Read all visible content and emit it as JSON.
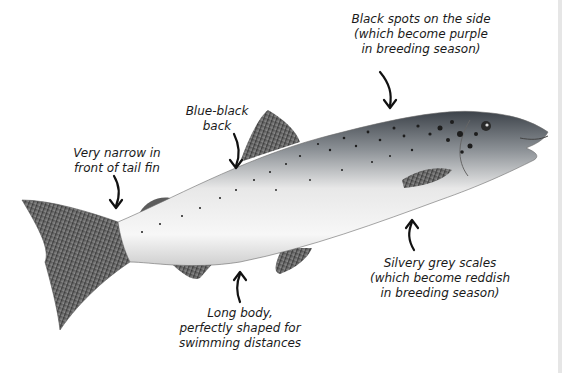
{
  "diagram": {
    "labels": [
      {
        "id": "spots",
        "text": "Black spots on the side\n(which become purple\nin breeding season)"
      },
      {
        "id": "back",
        "text": "Blue-black\nback"
      },
      {
        "id": "tail",
        "text": "Very narrow in\nfront of tail fin"
      },
      {
        "id": "scales",
        "text": "Silvery grey scales\n(which become reddish\nin breeding season)"
      },
      {
        "id": "body",
        "text": "Long body,\nperfectly shaped for\nswimming distances"
      }
    ]
  },
  "colors": {
    "text": "#1a1a1a",
    "arrow": "#111111",
    "fin": "#5a5a5a",
    "back": "#4a4f55",
    "belly": "#f4f4f4"
  }
}
